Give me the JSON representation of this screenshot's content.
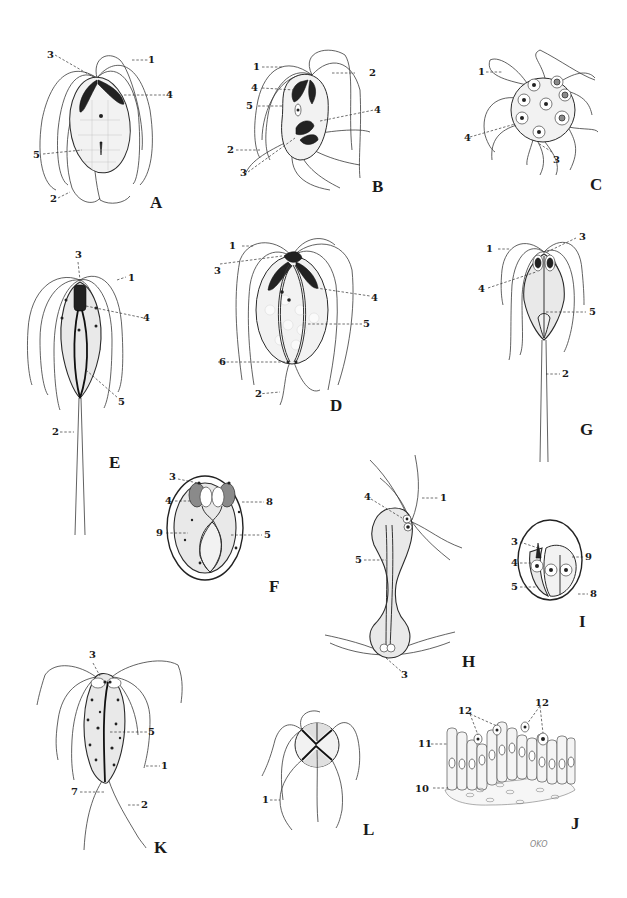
{
  "plate": {
    "description": "Plate of flagellate protozoa (Giardia, Hexamita, Trichomonas-type forms) with numbered structure labels",
    "signature": "OKO"
  },
  "panels": {
    "A": {
      "letter": "A",
      "labels": [
        "1",
        "2",
        "3",
        "4",
        "5"
      ]
    },
    "B": {
      "letter": "B",
      "labels": [
        "1",
        "2",
        "3",
        "4",
        "4",
        "5",
        "2",
        "3"
      ]
    },
    "C": {
      "letter": "C",
      "labels": [
        "1",
        "3",
        "4"
      ]
    },
    "D": {
      "letter": "D",
      "labels": [
        "1",
        "2",
        "3",
        "4",
        "5",
        "6"
      ]
    },
    "E": {
      "letter": "E",
      "labels": [
        "1",
        "2",
        "3",
        "4",
        "5"
      ]
    },
    "F": {
      "letter": "F",
      "labels": [
        "3",
        "4",
        "5",
        "8",
        "9"
      ]
    },
    "G": {
      "letter": "G",
      "labels": [
        "1",
        "2",
        "3",
        "4",
        "5"
      ]
    },
    "H": {
      "letter": "H",
      "labels": [
        "1",
        "3",
        "4",
        "5"
      ]
    },
    "I": {
      "letter": "I",
      "labels": [
        "3",
        "4",
        "5",
        "8",
        "9"
      ]
    },
    "J": {
      "letter": "J",
      "labels": [
        "10",
        "11",
        "12",
        "12"
      ]
    },
    "K": {
      "letter": "K",
      "labels": [
        "1",
        "2",
        "3",
        "5",
        "7"
      ]
    },
    "L": {
      "letter": "L",
      "labels": [
        "1"
      ]
    }
  }
}
